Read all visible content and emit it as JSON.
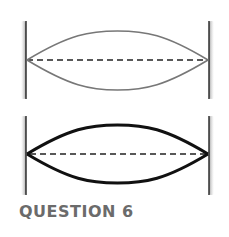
{
  "diagrams": [
    {
      "id": "top",
      "style": "thin-gray",
      "stroke": "#777777",
      "stroke_width": 1.6,
      "wall_top": 21,
      "wall_bottom": 99,
      "center_y": 60,
      "crest_y": 31,
      "trough_y": 90
    },
    {
      "id": "bottom",
      "style": "thick-black",
      "stroke": "#111111",
      "stroke_width": 3,
      "wall_top": 116,
      "wall_bottom": 195,
      "center_y": 154,
      "crest_y": 125,
      "trough_y": 183
    }
  ],
  "wall_left_x": 26,
  "wall_right_x": 209,
  "caption": "QUESTION 6"
}
